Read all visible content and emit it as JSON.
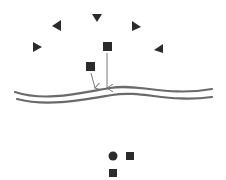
{
  "diagram": {
    "title": "",
    "colors": {
      "shape_fill": "#2b2b2b",
      "arrow_stroke": "#777777",
      "wave_stroke": "#6a6a6a",
      "background": "#ffffff"
    },
    "triangles": [
      {
        "id": "tri-left-low",
        "x": 37,
        "y": 47,
        "rotation": 0
      },
      {
        "id": "tri-left-high",
        "x": 57,
        "y": 25,
        "rotation": 200
      },
      {
        "id": "tri-top",
        "x": 97,
        "y": 18,
        "rotation": 90
      },
      {
        "id": "tri-right-high",
        "x": 136,
        "y": 26,
        "rotation": 20
      },
      {
        "id": "tri-right-low",
        "x": 159,
        "y": 49,
        "rotation": 180
      }
    ],
    "squares_falling": [
      {
        "id": "square-upper",
        "x": 107,
        "y": 48,
        "arrow_to": [
          107,
          88
        ]
      },
      {
        "id": "square-lower",
        "x": 90,
        "y": 66,
        "arrow_to": [
          95,
          88
        ]
      }
    ],
    "surface": {
      "label": "wavy-surface",
      "lines": 2
    },
    "bottom_group": [
      {
        "shape": "circle",
        "x": 113,
        "y": 156
      },
      {
        "shape": "square",
        "x": 130,
        "y": 156
      },
      {
        "shape": "square",
        "x": 113,
        "y": 173
      }
    ]
  }
}
